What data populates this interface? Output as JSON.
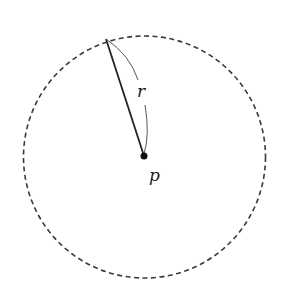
{
  "diagram": {
    "title": "",
    "circle": {
      "center": [
        144.5,
        156.5
      ],
      "radius": 121,
      "style": "dashed",
      "color": "#333333"
    },
    "center_point": {
      "label": "p",
      "x": 144,
      "y": 156
    },
    "radius_segment": {
      "label": "r",
      "from": [
        144,
        156
      ],
      "to": [
        106,
        39
      ]
    },
    "labels": {
      "radius": "r",
      "center": "p"
    }
  }
}
